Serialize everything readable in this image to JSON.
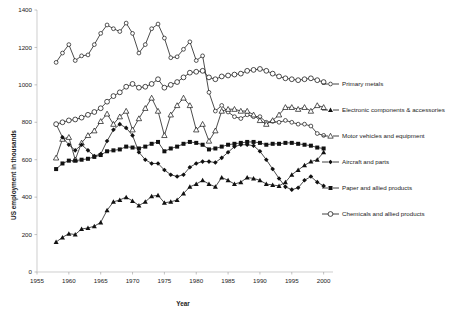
{
  "chart_data": {
    "type": "line",
    "title": "",
    "xlabel": "Year",
    "ylabel": "US employment in thousands",
    "xlim": [
      1955,
      2001
    ],
    "ylim": [
      0,
      1400
    ],
    "grid": false,
    "legend_position": "right",
    "x_ticks": [
      "1955",
      "1960",
      "1965",
      "1970",
      "1975",
      "1980",
      "1985",
      "1990",
      "1995",
      "2000"
    ],
    "y_ticks": [
      "0",
      "200",
      "400",
      "600",
      "800",
      "1000",
      "1200",
      "1400"
    ],
    "x": [
      1958,
      1959,
      1960,
      1961,
      1962,
      1963,
      1964,
      1965,
      1966,
      1967,
      1968,
      1969,
      1970,
      1971,
      1972,
      1973,
      1974,
      1975,
      1976,
      1977,
      1978,
      1979,
      1980,
      1981,
      1982,
      1983,
      1984,
      1985,
      1986,
      1987,
      1988,
      1989,
      1990,
      1991,
      1992,
      1993,
      1994,
      1995,
      1996,
      1997,
      1998,
      1999,
      2000
    ],
    "series": [
      {
        "name": "Primary metals",
        "marker": "open-circle-small",
        "values": [
          1120,
          1170,
          1215,
          1130,
          1155,
          1160,
          1215,
          1275,
          1320,
          1300,
          1285,
          1330,
          1275,
          1170,
          1215,
          1300,
          1325,
          1250,
          1145,
          1150,
          1190,
          1230,
          1130,
          1155,
          960,
          860,
          890,
          855,
          830,
          820,
          840,
          830,
          830,
          800,
          805,
          800,
          810,
          800,
          790,
          790,
          780,
          740,
          730
        ]
      },
      {
        "name": "Electronic components & accessories",
        "marker": "filled-triangle",
        "values": [
          160,
          185,
          205,
          200,
          230,
          235,
          245,
          265,
          330,
          375,
          385,
          400,
          380,
          355,
          375,
          405,
          410,
          370,
          375,
          385,
          420,
          455,
          470,
          490,
          470,
          455,
          505,
          490,
          470,
          480,
          505,
          500,
          490,
          470,
          465,
          460,
          480,
          520,
          545,
          570,
          590,
          600,
          640
        ]
      },
      {
        "name": "Motor vehicles and equipment",
        "marker": "open-triangle",
        "values": [
          610,
          710,
          720,
          600,
          690,
          730,
          755,
          805,
          845,
          790,
          830,
          860,
          760,
          820,
          875,
          930,
          860,
          730,
          840,
          890,
          930,
          890,
          760,
          790,
          700,
          755,
          860,
          870,
          870,
          860,
          860,
          840,
          810,
          790,
          810,
          840,
          880,
          880,
          870,
          880,
          860,
          890,
          880
        ]
      },
      {
        "name": "Aircraft and parts",
        "marker": "filled-diamond",
        "values": [
          790,
          720,
          680,
          650,
          680,
          650,
          620,
          630,
          700,
          760,
          790,
          770,
          730,
          640,
          600,
          580,
          580,
          545,
          520,
          510,
          520,
          560,
          580,
          590,
          590,
          585,
          610,
          640,
          670,
          680,
          680,
          675,
          645,
          600,
          550,
          500,
          455,
          440,
          450,
          490,
          510,
          480,
          460
        ]
      },
      {
        "name": "Paper and allied products",
        "marker": "filled-square",
        "values": [
          550,
          580,
          595,
          595,
          600,
          605,
          615,
          625,
          645,
          650,
          655,
          670,
          665,
          660,
          670,
          685,
          695,
          645,
          660,
          670,
          685,
          695,
          690,
          680,
          655,
          660,
          670,
          680,
          685,
          690,
          695,
          695,
          690,
          680,
          685,
          685,
          690,
          690,
          685,
          680,
          675,
          665,
          660
        ]
      },
      {
        "name": "Chemicals and allied products",
        "marker": "open-circle-large",
        "values": [
          790,
          800,
          810,
          815,
          825,
          840,
          855,
          875,
          910,
          940,
          960,
          990,
          1005,
          985,
          990,
          1005,
          1030,
          985,
          1000,
          1015,
          1040,
          1065,
          1070,
          1075,
          1040,
          1030,
          1045,
          1050,
          1055,
          1060,
          1075,
          1080,
          1085,
          1075,
          1060,
          1045,
          1035,
          1030,
          1025,
          1030,
          1035,
          1025,
          1015
        ]
      }
    ]
  },
  "legend": {
    "items": [
      {
        "label": "Primary metals",
        "marker": "open-circle-small"
      },
      {
        "label": "Electronic components & accessories",
        "marker": "filled-triangle"
      },
      {
        "label": "Motor vehicles and equipment",
        "marker": "open-triangle"
      },
      {
        "label": "Aircraft and parts",
        "marker": "filled-diamond"
      },
      {
        "label": "Paper and allied products",
        "marker": "filled-square"
      },
      {
        "label": "Chemicals and allied products",
        "marker": "open-circle-large"
      }
    ]
  },
  "colors": {
    "ink": "#111111",
    "axis": "#b9b9b9",
    "background": "#ffffff"
  }
}
